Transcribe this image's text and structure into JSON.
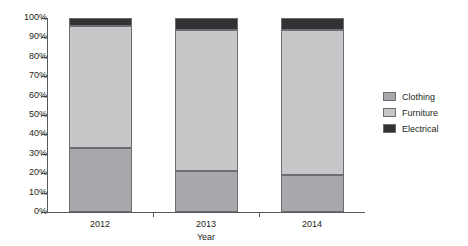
{
  "chart_data": {
    "type": "bar",
    "subtype": "stacked-100-percent",
    "title": "",
    "xlabel": "Year",
    "ylabel": "",
    "categories": [
      "2012",
      "2013",
      "2014"
    ],
    "series": [
      {
        "name": "Clothing",
        "color": "#a6a8ab",
        "values": [
          33,
          21,
          19
        ]
      },
      {
        "name": "Furniture",
        "color": "#c6c7c9",
        "values": [
          63,
          73,
          75
        ]
      },
      {
        "name": "Electrical",
        "color": "#323234",
        "values": [
          4,
          6,
          6
        ]
      }
    ],
    "ylim": [
      0,
      100
    ],
    "ytick_labels": [
      "0%",
      "10%",
      "20%",
      "30%",
      "40%",
      "50%",
      "60%",
      "70%",
      "80%",
      "90%",
      "100%"
    ],
    "ytick_values": [
      0,
      10,
      20,
      30,
      40,
      50,
      60,
      70,
      80,
      90,
      100
    ],
    "grid": false,
    "legend_position": "right",
    "axis_color": "#58595b",
    "segment_border_color": "#6d6e71"
  }
}
